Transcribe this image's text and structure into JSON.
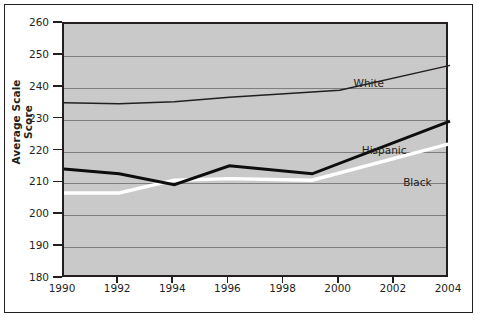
{
  "chart_data": {
    "type": "line",
    "title": "",
    "subtitle": "",
    "xlabel": "",
    "ylabel": "Average Scale Score",
    "xlim": [
      1990,
      2004
    ],
    "ylim": [
      180,
      260
    ],
    "grid": true,
    "legend_position": "inline-right",
    "xticks": [
      1990,
      1992,
      1994,
      1996,
      1998,
      2000,
      2002,
      2004
    ],
    "xtick_labels": [
      "1990",
      "1992",
      "1994",
      "1996",
      "1998",
      "2000",
      "2002",
      "2004"
    ],
    "yticks": [
      180,
      190,
      200,
      210,
      220,
      230,
      240,
      250,
      260
    ],
    "ytick_labels": [
      "180",
      "190",
      "200",
      "210",
      "220",
      "230",
      "240",
      "250",
      "260"
    ],
    "series": [
      {
        "name": "White",
        "style": "thin-black",
        "color": "#231f20",
        "x": [
          1990,
          1992,
          1994,
          1996,
          2000,
          2004
        ],
        "values": [
          235.3,
          235.0,
          235.6,
          237.0,
          239.2,
          247.0
        ]
      },
      {
        "name": "Hispanic",
        "style": "thick-black",
        "color": "#0d0d0d",
        "x": [
          1990,
          1992,
          1994,
          1996,
          1999,
          2004
        ],
        "values": [
          214.5,
          213.0,
          209.6,
          215.5,
          213.0,
          229.5
        ]
      },
      {
        "name": "Black",
        "style": "thick-white",
        "color": "#ffffff",
        "x": [
          1990,
          1992,
          1994,
          1996,
          1999,
          2004
        ],
        "values": [
          207.0,
          207.0,
          211.0,
          211.5,
          211.0,
          222.5
        ]
      }
    ],
    "annotations": [
      {
        "text": "White",
        "x": 2000.5,
        "y": 241.5
      },
      {
        "text": "Hispanic",
        "x": 2000.8,
        "y": 220.5
      },
      {
        "text": "Black",
        "x": 2002.3,
        "y": 210.5
      }
    ]
  },
  "axis": {
    "y_title": "Average Scale Score"
  }
}
